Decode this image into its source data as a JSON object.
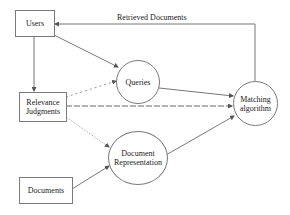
{
  "diagram": {
    "nodes": {
      "users": {
        "label": "Users",
        "shape": "rectangle"
      },
      "relevance": {
        "line1": "Relevance",
        "line2": "Judgments",
        "shape": "rectangle"
      },
      "documents": {
        "label": "Documents",
        "shape": "rectangle"
      },
      "queries": {
        "label": "Queries",
        "shape": "ellipse"
      },
      "docrep": {
        "line1": "Document",
        "line2": "Representation",
        "shape": "ellipse"
      },
      "matching": {
        "line1": "Matching",
        "line2": "algorithm",
        "shape": "ellipse"
      }
    },
    "edges": [
      {
        "from": "Users",
        "to": "Relevance Judgments",
        "style": "solid"
      },
      {
        "from": "Users",
        "to": "Queries",
        "style": "solid"
      },
      {
        "from": "Matching algorithm",
        "to": "Users",
        "style": "solid",
        "label": "Retrieved Documents"
      },
      {
        "from": "Relevance Judgments",
        "to": "Queries",
        "style": "dotted"
      },
      {
        "from": "Relevance Judgments",
        "to": "Matching algorithm",
        "style": "dashed"
      },
      {
        "from": "Relevance Judgments",
        "to": "Document Representation",
        "style": "dotted"
      },
      {
        "from": "Documents",
        "to": "Document Representation",
        "style": "solid"
      },
      {
        "from": "Queries",
        "to": "Matching algorithm",
        "style": "solid"
      },
      {
        "from": "Document Representation",
        "to": "Matching algorithm",
        "style": "solid"
      }
    ],
    "edge_label": "Retrieved Documents"
  }
}
